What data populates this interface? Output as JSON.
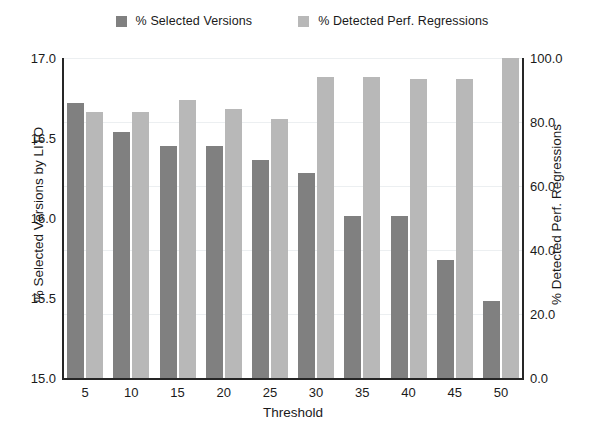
{
  "chart_data": {
    "type": "bar",
    "title": "",
    "subtitle": "",
    "xlabel": "Threshold",
    "ylabel": "% Selected Versions by LITO",
    "ylabel_right": "% Detected Perf. Regressions",
    "categories": [
      "5",
      "10",
      "15",
      "20",
      "25",
      "30",
      "35",
      "40",
      "45",
      "50"
    ],
    "grid": true,
    "legend_position": "top-center",
    "ylim": [
      15.0,
      17.0
    ],
    "ylim_right": [
      0.0,
      100.0
    ],
    "yticks": [
      "17.0",
      "16.5",
      "16.0",
      "15.5",
      "15.0"
    ],
    "ytick_values": [
      17.0,
      16.5,
      16.0,
      15.5,
      15.0
    ],
    "yticks_right": [
      "100.0",
      "80.0",
      "60.0",
      "40.0",
      "20.0",
      "0.0"
    ],
    "ytick_values_right": [
      100.0,
      80.0,
      60.0,
      40.0,
      20.0,
      0.0
    ],
    "series": [
      {
        "name": "% Selected Versions",
        "axis": "left",
        "color": "#808080",
        "values": [
          16.72,
          16.54,
          16.45,
          16.45,
          16.36,
          16.28,
          16.01,
          16.01,
          15.74,
          15.48
        ]
      },
      {
        "name": "% Detected Perf. Regressions",
        "axis": "right",
        "color": "#b8b8b8",
        "values": [
          83.0,
          83.0,
          87.0,
          84.0,
          81.0,
          94.0,
          94.0,
          93.5,
          93.5,
          100.0
        ]
      }
    ]
  },
  "legend": {
    "entries": [
      {
        "label": "% Selected Versions",
        "color": "#808080"
      },
      {
        "label": "% Detected Perf. Regressions",
        "color": "#b8b8b8"
      }
    ]
  }
}
